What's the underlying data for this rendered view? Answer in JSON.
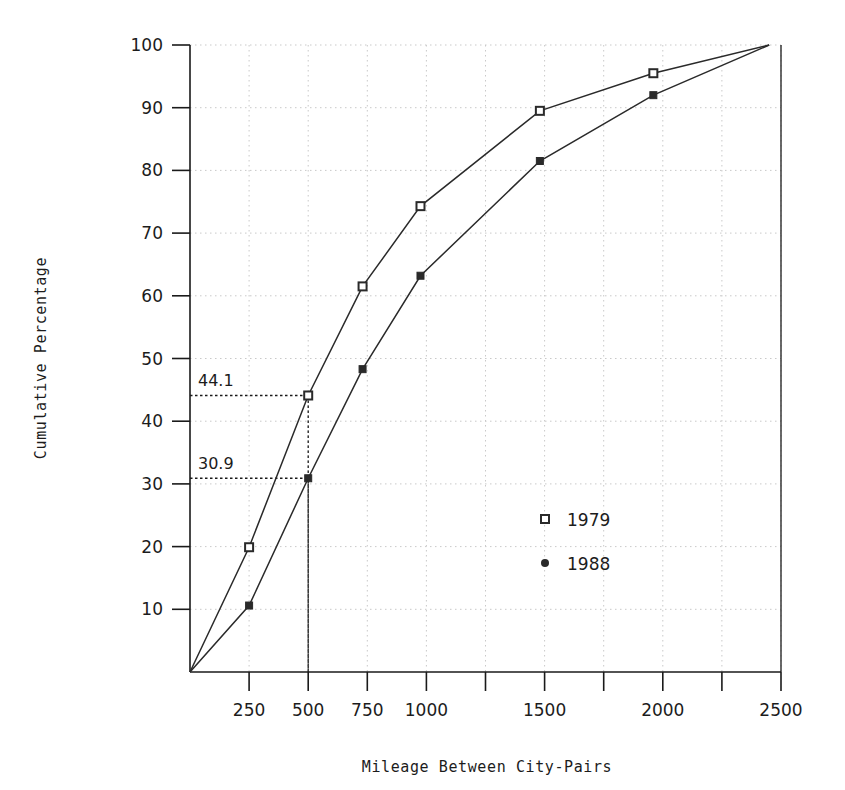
{
  "chart_data": {
    "type": "line",
    "title": "",
    "xlabel": "Mileage Between City-Pairs",
    "ylabel": "Cumulative Percentage",
    "xlim": [
      0,
      2500
    ],
    "ylim": [
      0,
      100
    ],
    "grid": true,
    "legend_position": "inside-right-lower",
    "x_ticks": [
      0,
      250,
      500,
      750,
      1000,
      1250,
      1500,
      1750,
      2000,
      2250,
      2500
    ],
    "x_tick_labels": [
      "",
      "250",
      "500",
      "750",
      "1000",
      "",
      "1500",
      "",
      "2000",
      "",
      "2500"
    ],
    "y_ticks": [
      0,
      10,
      20,
      30,
      40,
      50,
      60,
      70,
      80,
      90,
      100
    ],
    "y_tick_labels": [
      "",
      "10",
      "20",
      "30",
      "40",
      "50",
      "60",
      "70",
      "80",
      "90",
      "100"
    ],
    "series": [
      {
        "name": "1979",
        "marker": "open-square",
        "x": [
          0,
          250,
          500,
          730,
          975,
          1480,
          1960,
          2450
        ],
        "values": [
          0,
          19.9,
          44.1,
          61.5,
          74.3,
          89.5,
          95.5,
          100
        ]
      },
      {
        "name": "1988",
        "marker": "filled-dot",
        "x": [
          0,
          250,
          500,
          730,
          975,
          1480,
          1960,
          2450
        ],
        "values": [
          0,
          10.6,
          30.9,
          48.3,
          63.2,
          81.5,
          92.0,
          100
        ]
      }
    ],
    "annotations": [
      {
        "label": "44.1",
        "series": "1979",
        "x": 500,
        "y": 44.1
      },
      {
        "label": "30.9",
        "series": "1988",
        "x": 500,
        "y": 30.9
      }
    ]
  },
  "legend": {
    "entries": [
      {
        "label": "1979",
        "marker": "open-square"
      },
      {
        "label": "1988",
        "marker": "filled-dot"
      }
    ]
  },
  "colors": {
    "line": "#2a2a2a",
    "grid": "#c9c9c9",
    "axis": "#1a1a1a",
    "annotation": "#1a1a1a",
    "background": "#ffffff"
  }
}
